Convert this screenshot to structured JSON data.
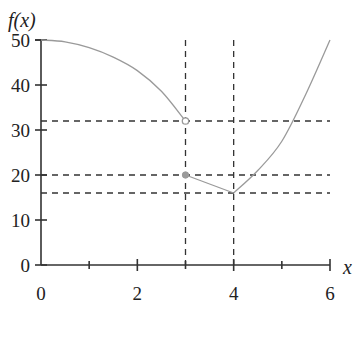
{
  "chart_data": {
    "type": "line",
    "title": "",
    "xlabel": "x",
    "ylabel": "f(x)",
    "xlim": [
      0,
      6
    ],
    "ylim": [
      0,
      50
    ],
    "x_ticks": [
      0,
      2,
      4,
      6
    ],
    "x_minor_ticks": [
      1,
      3,
      5
    ],
    "y_ticks": [
      0,
      10,
      20,
      30,
      40,
      50
    ],
    "grid": false,
    "series": [
      {
        "name": "f(x) piece 1 (decreasing curve)",
        "x": [
          0,
          0.5,
          1,
          1.5,
          2,
          2.5,
          3
        ],
        "values": [
          50,
          49.6,
          48.3,
          46.2,
          43.2,
          38.6,
          32
        ],
        "end_marker": "open circle at (3, 32)"
      },
      {
        "name": "f(x) piece 2 (line segment)",
        "x": [
          3,
          4
        ],
        "values": [
          20,
          16
        ],
        "start_marker": "filled point at (3, 20)"
      },
      {
        "name": "f(x) piece 3 (increasing curve)",
        "x": [
          4,
          4.5,
          5,
          5.5,
          6
        ],
        "values": [
          16,
          21,
          27.5,
          38,
          50
        ]
      }
    ],
    "reference_lines": {
      "vertical_dashed": [
        3,
        4
      ],
      "horizontal_dashed": [
        32,
        20,
        16
      ]
    },
    "annotations": [
      "open circle at (3, 32)",
      "filled point at (3, 20)",
      "minimum at (4, 16)"
    ]
  },
  "labels": {
    "y_axis_title": "f(x)",
    "x_axis_title": "x",
    "y_tick_labels": [
      "0",
      "10",
      "20",
      "30",
      "40",
      "50"
    ],
    "x_tick_labels": [
      "0",
      "2",
      "4",
      "6"
    ]
  }
}
